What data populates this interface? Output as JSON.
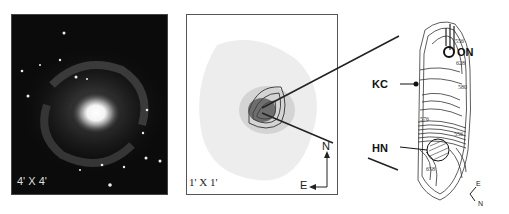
{
  "panels": [
    {
      "id": "galaxy-optical",
      "scale_label": "4' X 4'"
    },
    {
      "id": "contour-overlay",
      "scale_label": "1' X 1'",
      "compass": {
        "north": "N",
        "east": "E"
      }
    },
    {
      "id": "contour-map",
      "labels": {
        "on": "ON",
        "kc": "KC",
        "hn": "HN"
      },
      "contour_values": [
        "556",
        "628",
        "580",
        "576",
        "556",
        "658"
      ],
      "compass": {
        "east": "E",
        "north": "N"
      }
    }
  ]
}
